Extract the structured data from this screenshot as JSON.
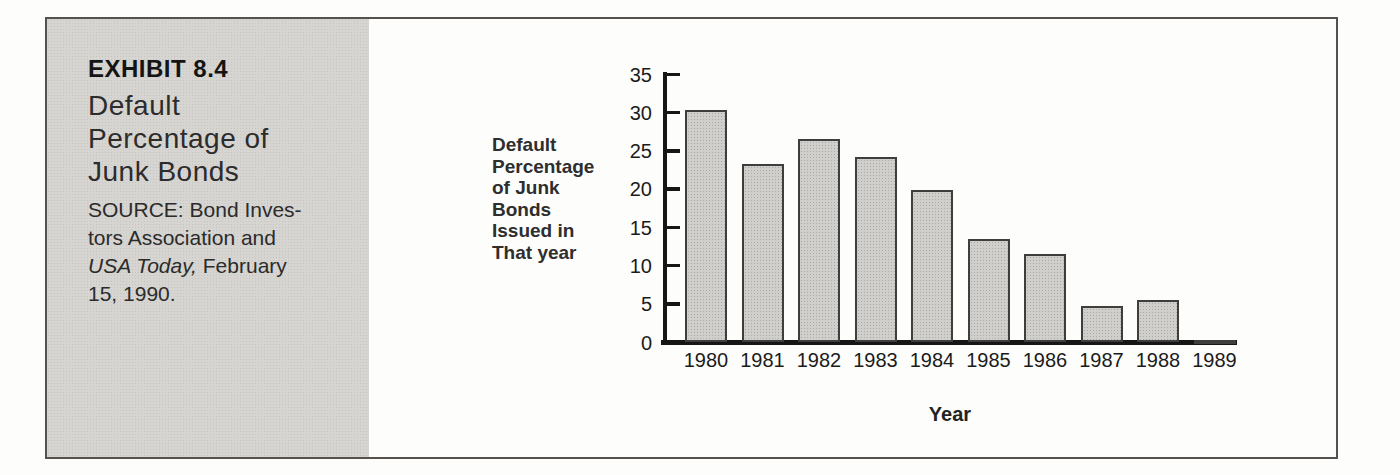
{
  "exhibit": {
    "label": "EXHIBIT 8.4",
    "title_lines": [
      "Default",
      "Percentage of",
      "Junk Bonds"
    ],
    "source": {
      "line1": "SOURCE: Bond Inves-",
      "line2": "tors Association and",
      "line3_italic": "USA Today,",
      "line3_rest": " February",
      "line4": "15, 1990."
    }
  },
  "chart_data": {
    "type": "bar",
    "title": "",
    "ylabel_lines": [
      "Default",
      "Percentage",
      "of Junk",
      "Bonds",
      "Issued in",
      "That year"
    ],
    "xlabel": "Year",
    "categories": [
      "1980",
      "1981",
      "1982",
      "1983",
      "1984",
      "1985",
      "1986",
      "1987",
      "1988",
      "1989"
    ],
    "values": [
      30.3,
      23.3,
      26.5,
      24.2,
      19.9,
      13.5,
      11.5,
      4.7,
      5.5,
      0.2
    ],
    "ylim": [
      0,
      35
    ],
    "yticks": [
      0,
      5,
      10,
      15,
      20,
      25,
      30,
      35
    ],
    "grid": false,
    "legend": "none",
    "bar_fill": "#d0cfcb",
    "bar_border": "#3e3e3c",
    "axis_color": "#161616",
    "text_color": "#1b1b1b",
    "label_color": "#2e2e2e"
  }
}
